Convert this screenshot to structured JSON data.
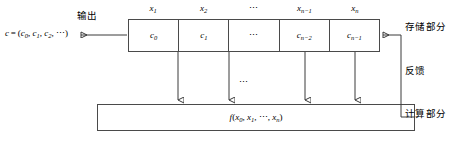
{
  "diagram": {
    "output": {
      "label": "输出",
      "formula_prefix": "c",
      "formula_eq": "=",
      "formula_body": "(c",
      "formula_full": "c = (c0, c1, c2, ...)"
    },
    "register": {
      "top_labels": [
        {
          "base": "x",
          "sub": "1"
        },
        {
          "base": "x",
          "sub": "2"
        },
        {
          "base": "⋯",
          "sub": ""
        },
        {
          "base": "x",
          "sub": "n−1"
        },
        {
          "base": "x",
          "sub": "n"
        }
      ],
      "cells": [
        {
          "base": "c",
          "sub": "0"
        },
        {
          "base": "c",
          "sub": "1"
        },
        {
          "base": "⋯",
          "sub": ""
        },
        {
          "base": "c",
          "sub": "n−2"
        },
        {
          "base": "c",
          "sub": "n−1"
        }
      ]
    },
    "middle_dots": "⋯",
    "function_box": {
      "name": "f",
      "args": "(x0, x1, ⋯, xn)"
    },
    "side_labels": {
      "storage": "存储部分",
      "feedback": "反馈",
      "computation": "计算部分"
    },
    "colors": {
      "stroke": "#3a3a3a",
      "box_border": "#4a4a4a",
      "background": "#ffffff",
      "text": "#000000"
    }
  }
}
